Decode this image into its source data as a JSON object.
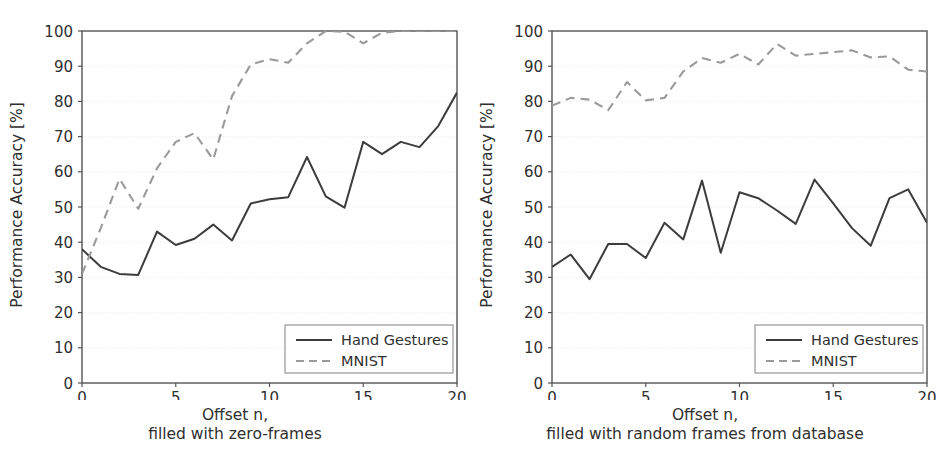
{
  "chart_data": [
    {
      "type": "line",
      "panel": "left",
      "title": "",
      "xlabel_line1": "Offset n,",
      "xlabel_line2": "filled with zero-frames",
      "ylabel": "Performance Accuracy [%]",
      "xlim": [
        0,
        20
      ],
      "ylim": [
        0,
        100
      ],
      "xticks": [
        0,
        5,
        10,
        15,
        20
      ],
      "yticks": [
        0,
        10,
        20,
        30,
        40,
        50,
        60,
        70,
        80,
        90,
        100
      ],
      "grid": true,
      "legend_position": "lower right",
      "x": [
        0,
        1,
        2,
        3,
        4,
        5,
        6,
        7,
        8,
        9,
        10,
        11,
        12,
        13,
        14,
        15,
        16,
        17,
        18,
        19,
        20
      ],
      "series": [
        {
          "name": "Hand Gestures",
          "style": "solid",
          "color": "#3c3c3c",
          "values": [
            38.0,
            33.0,
            31.0,
            30.7,
            43.0,
            39.2,
            41.0,
            45.0,
            40.5,
            51.0,
            52.2,
            52.8,
            64.2,
            53.0,
            49.8,
            68.5,
            65.0,
            68.5,
            67.0,
            73.0,
            82.5,
            79.0
          ]
        },
        {
          "name": "MNIST",
          "style": "dashed",
          "color": "#9a9a9a",
          "values": [
            31.0,
            44.0,
            58.0,
            49.5,
            61.0,
            68.5,
            71.0,
            63.5,
            81.5,
            90.5,
            92.0,
            91.0,
            96.5,
            100.0,
            99.8,
            96.5,
            99.5,
            100.0,
            100.0,
            100.0,
            100.0
          ]
        }
      ]
    },
    {
      "type": "line",
      "panel": "right",
      "title": "",
      "xlabel_line1": "Offset n,",
      "xlabel_line2": "filled with random frames from database",
      "ylabel": "Performance Accuracy [%]",
      "xlim": [
        0,
        20
      ],
      "ylim": [
        0,
        100
      ],
      "xticks": [
        0,
        5,
        10,
        15,
        20
      ],
      "yticks": [
        0,
        10,
        20,
        30,
        40,
        50,
        60,
        70,
        80,
        90,
        100
      ],
      "grid": true,
      "legend_position": "lower right",
      "x": [
        0,
        1,
        2,
        3,
        4,
        5,
        6,
        7,
        8,
        9,
        10,
        11,
        12,
        13,
        14,
        15,
        16,
        17,
        18,
        19,
        20
      ],
      "series": [
        {
          "name": "Hand Gestures",
          "style": "solid",
          "color": "#3c3c3c",
          "values": [
            33.0,
            36.5,
            29.5,
            39.5,
            39.5,
            35.5,
            45.5,
            40.8,
            57.5,
            37.0,
            54.2,
            52.5,
            49.0,
            45.2,
            57.8,
            51.0,
            44.0,
            39.0,
            52.5,
            55.0,
            45.5
          ]
        },
        {
          "name": "MNIST",
          "style": "dashed",
          "color": "#9a9a9a",
          "values": [
            78.8,
            81.0,
            80.5,
            77.5,
            85.5,
            80.3,
            81.0,
            88.5,
            92.3,
            91.0,
            93.5,
            90.5,
            96.3,
            93.0,
            93.5,
            94.0,
            94.5,
            92.5,
            92.8,
            89.0,
            88.5
          ]
        }
      ]
    }
  ],
  "legend": {
    "entries": [
      {
        "label": "Hand Gestures",
        "style": "solid"
      },
      {
        "label": "MNIST",
        "style": "dashed"
      }
    ]
  },
  "colors": {
    "solid_line": "#3c3c3c",
    "dashed_line": "#9a9a9a",
    "axis": "#555555",
    "grid": "#e8e8ee",
    "text": "#2f2f2f",
    "background": "#ffffff"
  }
}
